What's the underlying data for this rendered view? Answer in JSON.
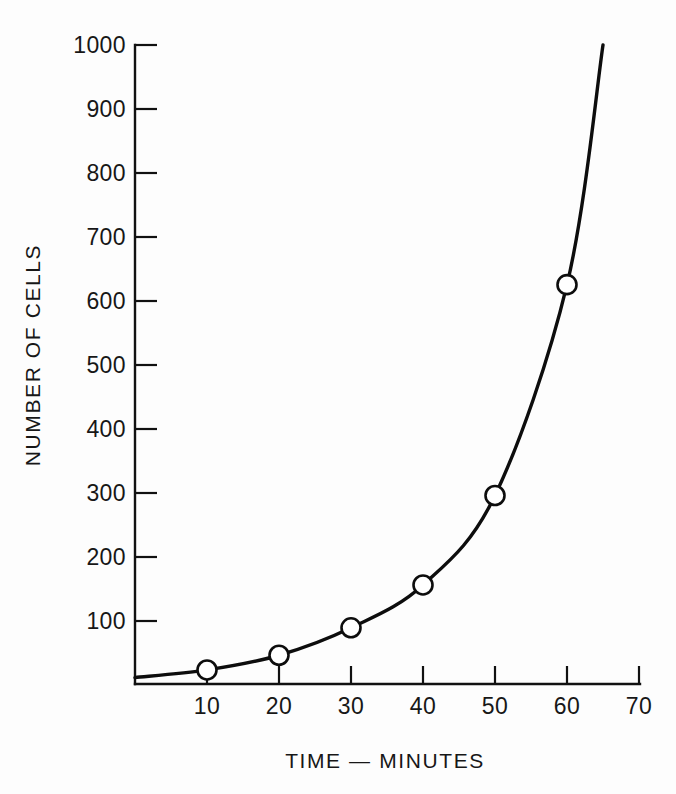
{
  "chart_data": {
    "type": "line",
    "title": "",
    "subtitle": "",
    "xlabel": "TIME — MINUTES",
    "ylabel": "NUMBER OF CELLS",
    "x": [
      10,
      20,
      30,
      40,
      50,
      60
    ],
    "values": [
      22,
      45,
      88,
      155,
      295,
      625
    ],
    "series": [
      {
        "name": "Number of cells",
        "x": [
          10,
          20,
          30,
          40,
          50,
          60
        ],
        "values": [
          22,
          45,
          88,
          155,
          295,
          625
        ]
      }
    ],
    "curve_extension": {
      "note": "curve continues past last marker",
      "x_end": 65,
      "y_end": 1000
    },
    "xlim": [
      0,
      70
    ],
    "ylim": [
      0,
      1000
    ],
    "x_ticks": [
      10,
      20,
      30,
      40,
      50,
      60,
      70
    ],
    "y_ticks": [
      100,
      200,
      300,
      400,
      500,
      600,
      700,
      800,
      900,
      1000
    ],
    "x_tick_labels": [
      "10",
      "20",
      "30",
      "40",
      "50",
      "60",
      "70"
    ],
    "y_tick_labels": [
      "100",
      "200",
      "300",
      "400",
      "500",
      "600",
      "700",
      "800",
      "900",
      "1000"
    ],
    "grid": false,
    "legend": false,
    "legend_position": "none",
    "marker": "open-circle",
    "line_color": "#0d0d0d",
    "marker_fill": "#ffffff",
    "background_color": "#ffffff",
    "annotations": []
  },
  "axes": {
    "y_axis_name": "y-axis",
    "x_axis_name": "x-axis"
  }
}
